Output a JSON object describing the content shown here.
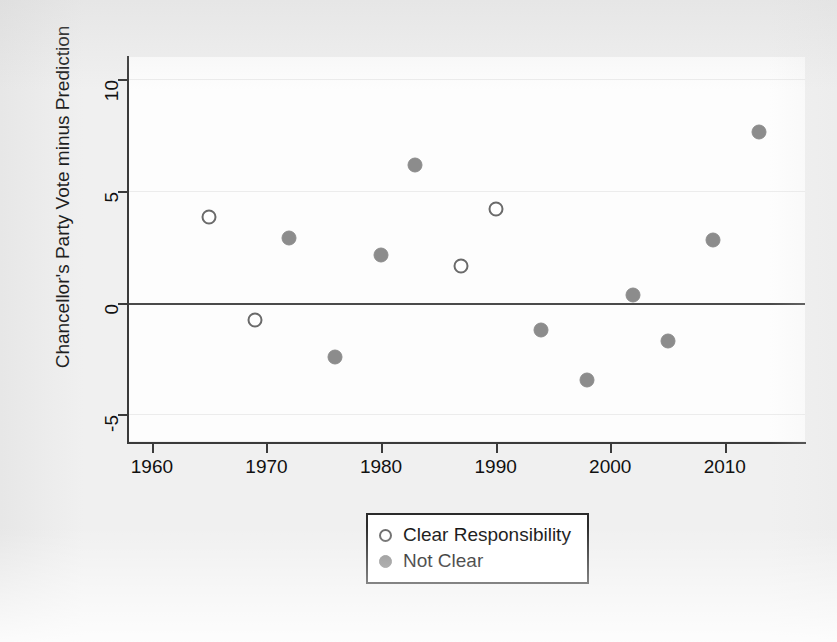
{
  "chart_data": {
    "type": "scatter",
    "title": "",
    "xlabel": "",
    "ylabel": "Chancellor's Party Vote minus Prediction",
    "xlim": [
      1958,
      2017
    ],
    "ylim": [
      -6.2,
      11.0
    ],
    "xticks": [
      1960,
      1970,
      1980,
      1990,
      2000,
      2010
    ],
    "xtick_labels": [
      "1960",
      "1970",
      "1980",
      "1990",
      "2000",
      "2010"
    ],
    "yticks": [
      -5,
      0,
      5,
      10
    ],
    "ytick_labels": [
      "-5",
      "0",
      "5",
      "10"
    ],
    "grid": true,
    "reference_line": 0,
    "legend_position": "bottom-center",
    "series": [
      {
        "name": "Clear Responsibility",
        "marker": "open-circle",
        "color": "#6a6a6a",
        "points": [
          {
            "x": 1965,
            "y": 3.85
          },
          {
            "x": 1969,
            "y": -0.8
          },
          {
            "x": 1987,
            "y": 1.65
          },
          {
            "x": 1990,
            "y": 4.2
          }
        ]
      },
      {
        "name": "Not Clear",
        "marker": "filled-circle",
        "color": "#8c8c8c",
        "points": [
          {
            "x": 1972,
            "y": 2.9
          },
          {
            "x": 1976,
            "y": -2.45
          },
          {
            "x": 1980,
            "y": 2.15
          },
          {
            "x": 1983,
            "y": 6.15
          },
          {
            "x": 1994,
            "y": -1.25
          },
          {
            "x": 1998,
            "y": -3.45
          },
          {
            "x": 2002,
            "y": 0.35
          },
          {
            "x": 2005,
            "y": -1.7
          },
          {
            "x": 2009,
            "y": 2.8
          },
          {
            "x": 2013,
            "y": 7.65
          }
        ]
      }
    ]
  },
  "legend": {
    "entries": [
      {
        "label": "Clear Responsibility",
        "marker": "open-circle"
      },
      {
        "label": "Not Clear",
        "marker": "filled-circle"
      }
    ]
  },
  "colors": {
    "page_background": "#f0f0f0",
    "plot_background": "#fdfdfd",
    "axis": "#3a3a3a",
    "zero_line": "#4a4a4a",
    "gridline": "#ececec",
    "open_marker_stroke": "#6a6a6a",
    "filled_marker": "#8c8c8c",
    "text": "#111111",
    "legend_border": "#2b2b2b"
  }
}
